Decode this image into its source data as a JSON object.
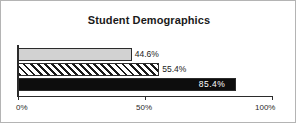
{
  "chart_data": {
    "type": "bar",
    "orientation": "horizontal",
    "title": "Student Demographics",
    "xlabel": "",
    "ylabel": "",
    "categories": [
      "",
      "",
      ""
    ],
    "values": [
      44.6,
      55.4,
      85.4
    ],
    "value_labels": [
      "44.6%",
      "55.4%",
      "85.4%"
    ],
    "xlim": [
      0,
      100
    ],
    "xticks": [
      0,
      50,
      100
    ],
    "xtick_labels": [
      "0%",
      "50%",
      "100%"
    ],
    "grid": false,
    "legend": "none",
    "series_styles": [
      "solid-light-gray",
      "diagonal-hatch",
      "solid-black"
    ],
    "colors": {
      "bar_light": "#d2d2d2",
      "bar_hatch_fg": "#1a1a1a",
      "bar_hatch_bg": "#ffffff",
      "bar_dark": "#0d0d0d",
      "axis": "#2b2b2b",
      "text": "#1a1a1a",
      "label_on_dark": "#ffffff",
      "frame_border": "#b4b4b4",
      "background": "#ffffff"
    }
  }
}
